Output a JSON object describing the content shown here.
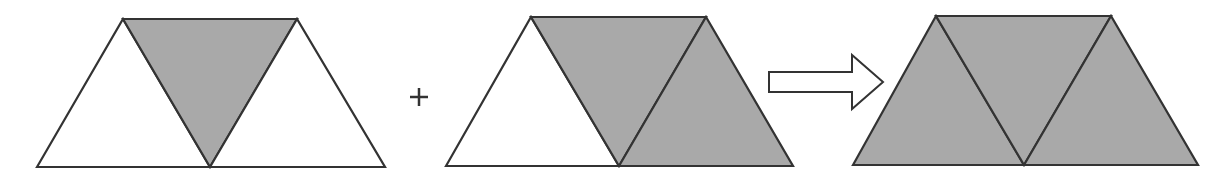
{
  "colors": {
    "background": "#ffffff",
    "stroke": "#333333",
    "shaded_fill": "#a9a9a9",
    "unshaded_fill": "#ffffff"
  },
  "figures": [
    {
      "name": "trapezoid-1",
      "description": "Trapezoid of three triangles; middle inverted triangle shaded",
      "vertices": {
        "top_left": [
          123,
          19
        ],
        "top_right": [
          297,
          19
        ],
        "bottom_left": [
          37,
          167
        ],
        "bottom_mid": [
          210,
          167
        ],
        "bottom_right": [
          385,
          167
        ]
      },
      "shaded": {
        "left": false,
        "middle": true,
        "right": false
      }
    },
    {
      "name": "trapezoid-2",
      "description": "Trapezoid of three triangles; middle and right triangles shaded",
      "vertices": {
        "top_left": [
          531,
          17
        ],
        "top_right": [
          706,
          17
        ],
        "bottom_left": [
          446,
          166
        ],
        "bottom_mid": [
          619,
          166
        ],
        "bottom_right": [
          793,
          166
        ]
      },
      "shaded": {
        "left": false,
        "middle": true,
        "right": true
      }
    },
    {
      "name": "trapezoid-3",
      "description": "Trapezoid of three triangles; all triangles shaded",
      "vertices": {
        "top_left": [
          936,
          16
        ],
        "top_right": [
          1111,
          16
        ],
        "bottom_left": [
          853,
          165
        ],
        "bottom_mid": [
          1024,
          165
        ],
        "bottom_right": [
          1198,
          165
        ]
      },
      "shaded": {
        "left": true,
        "middle": true,
        "right": true
      }
    }
  ],
  "operators": {
    "plus": {
      "symbol": "+",
      "center": [
        419,
        97
      ],
      "arm": 9
    },
    "arrow": {
      "symbol": "⇒",
      "shaft_x": [
        769,
        852
      ],
      "shaft_y": [
        72,
        92
      ],
      "head_y": [
        55,
        109
      ],
      "tip": [
        883,
        82
      ]
    }
  }
}
